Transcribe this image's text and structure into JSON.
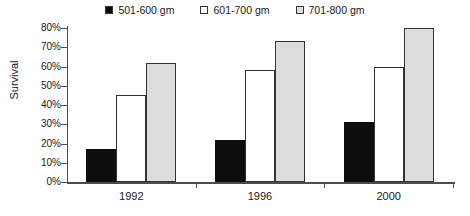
{
  "chart_data": {
    "type": "bar",
    "title": "",
    "xlabel": "",
    "ylabel": "Survival",
    "categories": [
      "1992",
      "1996",
      "2000"
    ],
    "series": [
      {
        "name": "501-600 gm",
        "values": [
          17,
          22,
          31
        ],
        "color": "#0d0d0d"
      },
      {
        "name": "601-700 gm",
        "values": [
          45,
          58,
          60
        ],
        "color": "#ffffff"
      },
      {
        "name": "701-800 gm",
        "values": [
          62,
          73,
          80
        ],
        "color": "#dcdcdc"
      }
    ],
    "ylim": [
      0,
      80
    ],
    "ytick_step": 10,
    "ytick_labels": [
      "0%",
      "10%",
      "20%",
      "30%",
      "40%",
      "50%",
      "60%",
      "70%",
      "80%"
    ],
    "grid": false,
    "legend_position": "top-center"
  }
}
